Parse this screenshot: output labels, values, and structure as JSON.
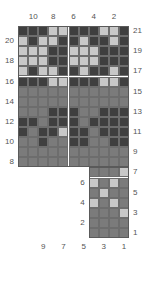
{
  "chart_data": {
    "type": "heatmap",
    "title": "",
    "xlabel": "",
    "ylabel": "",
    "grid": {
      "upper_cols": 11,
      "upper_rows": 14,
      "lower_cols": 4,
      "lower_rows": 7,
      "cell_size": 10.1,
      "origin_x": 18,
      "origin_y": 26
    },
    "palette": {
      "dark": "#3f3f3f",
      "mid": "#7b7b7b",
      "light": "#c8c8c8",
      "gridline": "#6d6d6d",
      "text": "#555555",
      "background": "#ffffff"
    },
    "legend": [
      {
        "key": "dark",
        "color": "#3f3f3f",
        "label": "dark"
      },
      {
        "key": "mid",
        "color": "#7b7b7b",
        "label": "mid"
      },
      {
        "key": "light",
        "color": "#c8c8c8",
        "label": "light"
      }
    ],
    "axes": {
      "top_ticks": [
        "10",
        "8",
        "6",
        "4",
        "2"
      ],
      "left_ticks": [
        "20",
        "18",
        "16",
        "14",
        "12",
        "10",
        "8"
      ],
      "right_ticks": [
        "21",
        "19",
        "17",
        "15",
        "13",
        "11",
        "9",
        "7",
        "5",
        "3",
        "1"
      ],
      "bottom_ticks": [
        "9",
        "7",
        "5",
        "3",
        "1"
      ],
      "lower_left_ticks": [
        "6",
        "4",
        "2"
      ]
    },
    "rows_top_to_bottom": [
      {
        "row": 21,
        "cells": [
          "dark",
          "dark",
          "dark",
          "light",
          "light",
          "dark",
          "dark",
          "dark",
          "light",
          "light",
          "dark"
        ]
      },
      {
        "row": 20,
        "cells": [
          "light",
          "dark",
          "light",
          "light",
          "dark",
          "dark",
          "light",
          "dark",
          "dark",
          "light",
          "dark"
        ]
      },
      {
        "row": 19,
        "cells": [
          "light",
          "light",
          "light",
          "dark",
          "dark",
          "light",
          "light",
          "light",
          "dark",
          "dark",
          "dark"
        ]
      },
      {
        "row": 18,
        "cells": [
          "light",
          "light",
          "light",
          "dark",
          "dark",
          "light",
          "light",
          "light",
          "dark",
          "dark",
          "dark"
        ]
      },
      {
        "row": 17,
        "cells": [
          "light",
          "dark",
          "light",
          "light",
          "dark",
          "dark",
          "light",
          "dark",
          "dark",
          "light",
          "dark"
        ]
      },
      {
        "row": 16,
        "cells": [
          "dark",
          "dark",
          "dark",
          "light",
          "light",
          "dark",
          "dark",
          "dark",
          "light",
          "light",
          "dark"
        ]
      },
      {
        "row": 15,
        "cells": [
          "mid",
          "mid",
          "mid",
          "mid",
          "mid",
          "mid",
          "mid",
          "mid",
          "mid",
          "mid",
          "mid"
        ]
      },
      {
        "row": 14,
        "cells": [
          "mid",
          "mid",
          "mid",
          "mid",
          "mid",
          "mid",
          "mid",
          "mid",
          "mid",
          "mid",
          "mid"
        ]
      },
      {
        "row": 13,
        "cells": [
          "mid",
          "mid",
          "mid",
          "dark",
          "dark",
          "dark",
          "mid",
          "mid",
          "dark",
          "dark",
          "dark"
        ]
      },
      {
        "row": 12,
        "cells": [
          "dark",
          "dark",
          "mid",
          "dark",
          "dark",
          "dark",
          "mid",
          "dark",
          "dark",
          "dark",
          "dark"
        ]
      },
      {
        "row": 11,
        "cells": [
          "dark",
          "mid",
          "dark",
          "dark",
          "light",
          "dark",
          "dark",
          "mid",
          "dark",
          "dark",
          "dark"
        ]
      },
      {
        "row": 10,
        "cells": [
          "mid",
          "mid",
          "dark",
          "mid",
          "mid",
          "dark",
          "dark",
          "mid",
          "mid",
          "dark",
          "dark"
        ]
      },
      {
        "row": 9,
        "cells": [
          "mid",
          "mid",
          "mid",
          "mid",
          "mid",
          "mid",
          "mid",
          "mid",
          "mid",
          "mid",
          "mid"
        ]
      },
      {
        "row": 8,
        "cells": [
          "mid",
          "mid",
          "mid",
          "mid",
          "mid",
          "mid",
          "mid",
          "mid",
          "mid",
          "mid",
          "mid"
        ]
      }
    ],
    "lower_rows_top_to_bottom": [
      {
        "row": 7,
        "cells": [
          "mid",
          "mid",
          "mid",
          "light"
        ]
      },
      {
        "row": 6,
        "cells": [
          "light",
          "mid",
          "light",
          "mid"
        ]
      },
      {
        "row": 5,
        "cells": [
          "mid",
          "light",
          "mid",
          "mid"
        ]
      },
      {
        "row": 4,
        "cells": [
          "light",
          "mid",
          "light",
          "mid"
        ]
      },
      {
        "row": 3,
        "cells": [
          "mid",
          "mid",
          "mid",
          "light"
        ]
      },
      {
        "row": 2,
        "cells": [
          "mid",
          "mid",
          "mid",
          "mid"
        ]
      },
      {
        "row": 1,
        "cells": [
          "mid",
          "mid",
          "mid",
          "mid"
        ]
      }
    ]
  }
}
